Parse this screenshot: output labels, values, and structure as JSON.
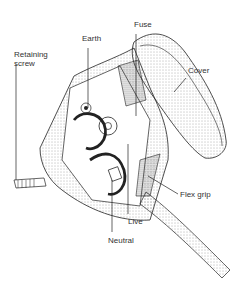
{
  "diagram": {
    "labels": {
      "fuse": "Fuse",
      "earth": "Earth",
      "retaining_screw_line1": "Retaining",
      "retaining_screw_line2": "screw",
      "cover": "Cover",
      "flex_grip": "Flex grip",
      "live": "Live",
      "neutral": "Neutral"
    }
  }
}
